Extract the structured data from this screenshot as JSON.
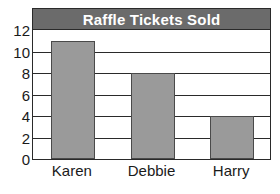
{
  "chart_data": {
    "type": "bar",
    "title": "Raffle Tickets Sold",
    "xlabel": "",
    "ylabel": "",
    "categories": [
      "Karen",
      "Debbie",
      "Harry"
    ],
    "values": [
      11,
      8,
      4
    ],
    "series": [
      {
        "name": "Raffle Tickets Sold",
        "values": [
          11,
          8,
          4
        ]
      }
    ],
    "ylim": [
      0,
      12
    ],
    "ytick_labels": [
      "0",
      "2",
      "4",
      "6",
      "8",
      "10",
      "12"
    ],
    "ytick_values": [
      0,
      2,
      4,
      6,
      8,
      10,
      12
    ],
    "gridlines": [
      2,
      4,
      6,
      8,
      10
    ],
    "grid": true,
    "legend": false,
    "legend_position": "none",
    "colors": {
      "bar_fill": "#9a9a9a",
      "bar_border": "#4a4a4a",
      "title_band": "#6b6b6b",
      "title_text": "#ffffff",
      "axis": "#2a2a2a",
      "plot_background": "#ffffff",
      "label_text": "#1a1a1a"
    }
  }
}
